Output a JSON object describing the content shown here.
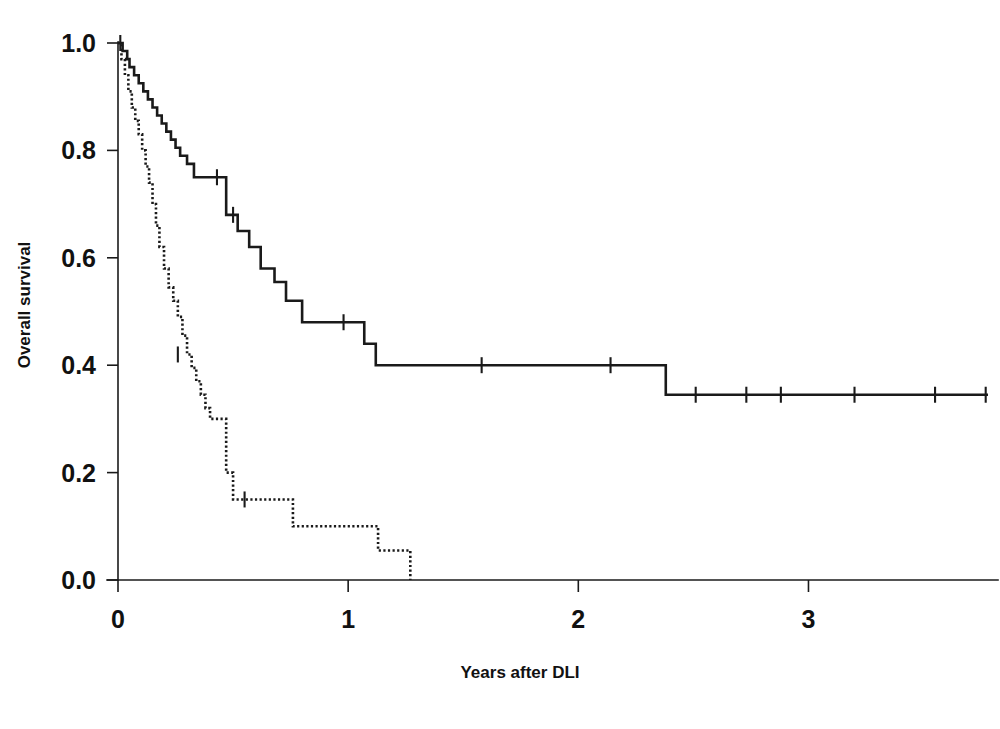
{
  "figure": {
    "name": "kaplan-meier-overall-survival",
    "background_color": "#ffffff",
    "line_color": "#1a1a1a"
  },
  "chart_data": {
    "type": "line",
    "title": "",
    "subtitle": "",
    "xlabel": "Years after DLI",
    "ylabel": "Overall survival",
    "xlim": [
      0,
      3.78
    ],
    "ylim": [
      0.0,
      1.0
    ],
    "grid": false,
    "legend": "none",
    "x_ticks": [
      0,
      1,
      2,
      3
    ],
    "x_tick_labels": [
      "0",
      "1",
      "2",
      "3"
    ],
    "y_ticks": [
      0.0,
      0.2,
      0.4,
      0.6,
      0.8,
      1.0
    ],
    "y_tick_labels": [
      "0.0",
      "0.2",
      "0.4",
      "0.6",
      "0.8",
      "1.0"
    ],
    "series": [
      {
        "name": "solid-curve",
        "style": "solid",
        "description": "Kaplan-Meier step curve, higher survival group",
        "x": [
          0.0,
          0.02,
          0.04,
          0.05,
          0.07,
          0.09,
          0.11,
          0.13,
          0.15,
          0.17,
          0.19,
          0.21,
          0.23,
          0.25,
          0.27,
          0.3,
          0.33,
          0.42,
          0.47,
          0.52,
          0.57,
          0.62,
          0.68,
          0.73,
          0.8,
          1.02,
          1.07,
          1.12,
          2.38,
          3.78
        ],
        "y": [
          1.0,
          0.985,
          0.97,
          0.955,
          0.94,
          0.925,
          0.91,
          0.895,
          0.88,
          0.865,
          0.85,
          0.835,
          0.82,
          0.805,
          0.79,
          0.775,
          0.75,
          0.75,
          0.68,
          0.65,
          0.62,
          0.58,
          0.555,
          0.52,
          0.48,
          0.48,
          0.44,
          0.4,
          0.345,
          0.345
        ],
        "censor_x": [
          0.01,
          0.43,
          0.5,
          0.98,
          1.58,
          2.14,
          2.51,
          2.73,
          2.88,
          3.2,
          3.55,
          3.77
        ],
        "censor_y": [
          1.0,
          0.75,
          0.68,
          0.48,
          0.4,
          0.4,
          0.345,
          0.345,
          0.345,
          0.345,
          0.345,
          0.345
        ]
      },
      {
        "name": "dotted-curve",
        "style": "dotted",
        "description": "Kaplan-Meier step curve, lower survival group",
        "x": [
          0.0,
          0.015,
          0.03,
          0.045,
          0.06,
          0.075,
          0.09,
          0.105,
          0.12,
          0.135,
          0.15,
          0.165,
          0.18,
          0.2,
          0.22,
          0.24,
          0.26,
          0.28,
          0.3,
          0.32,
          0.34,
          0.36,
          0.38,
          0.4,
          0.44,
          0.47,
          0.5,
          0.73,
          0.76,
          1.1,
          1.13,
          1.26,
          1.27
        ],
        "y": [
          1.0,
          0.97,
          0.94,
          0.91,
          0.88,
          0.855,
          0.83,
          0.8,
          0.77,
          0.74,
          0.7,
          0.66,
          0.62,
          0.58,
          0.545,
          0.52,
          0.49,
          0.455,
          0.42,
          0.395,
          0.37,
          0.345,
          0.32,
          0.3,
          0.3,
          0.2,
          0.15,
          0.15,
          0.1,
          0.1,
          0.055,
          0.055,
          0.0
        ],
        "censor_x": [
          0.26,
          0.55
        ],
        "censor_y": [
          0.42,
          0.15
        ]
      }
    ]
  },
  "labels": {
    "y_axis_title": "Overall survival",
    "x_axis_title": "Years after DLI"
  }
}
